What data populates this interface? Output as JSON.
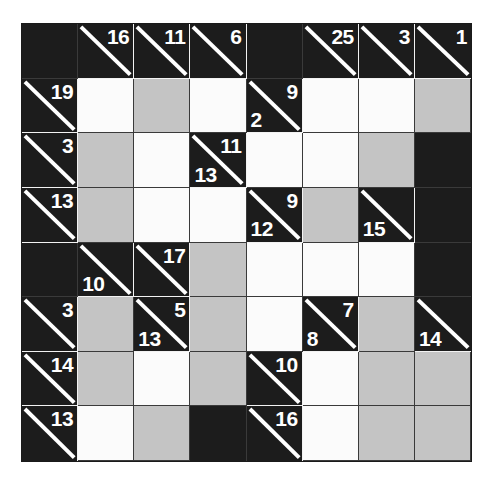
{
  "puzzle": {
    "name": "Kakuro",
    "rows": 8,
    "cols": 8,
    "colors": {
      "clue_cell": "#1c1c1c",
      "blank_cell": "#1c1c1c",
      "open_white": "#fbfbfb",
      "open_gray": "#c4c4c4",
      "clue_text": "#ffffff",
      "grid_line": "#f2f2f2",
      "page_background": "#ffffff"
    },
    "cells": [
      [
        {
          "type": "blank"
        },
        {
          "type": "clue",
          "across": "16",
          "down": ""
        },
        {
          "type": "clue",
          "across": "11",
          "down": ""
        },
        {
          "type": "clue",
          "across": "6",
          "down": ""
        },
        {
          "type": "blank"
        },
        {
          "type": "clue",
          "across": "25",
          "down": ""
        },
        {
          "type": "clue",
          "across": "3",
          "down": ""
        },
        {
          "type": "clue",
          "across": "1",
          "down": ""
        }
      ],
      [
        {
          "type": "clue",
          "across": "19",
          "down": ""
        },
        {
          "type": "open",
          "shade": "white",
          "value": ""
        },
        {
          "type": "open",
          "shade": "gray",
          "value": ""
        },
        {
          "type": "open",
          "shade": "white",
          "value": ""
        },
        {
          "type": "clue",
          "across": "9",
          "down": "2"
        },
        {
          "type": "open",
          "shade": "white",
          "value": ""
        },
        {
          "type": "open",
          "shade": "white",
          "value": ""
        },
        {
          "type": "open",
          "shade": "gray",
          "value": ""
        }
      ],
      [
        {
          "type": "clue",
          "across": "3",
          "down": ""
        },
        {
          "type": "open",
          "shade": "gray",
          "value": ""
        },
        {
          "type": "open",
          "shade": "white",
          "value": ""
        },
        {
          "type": "clue",
          "across": "11",
          "down": "13"
        },
        {
          "type": "open",
          "shade": "white",
          "value": ""
        },
        {
          "type": "open",
          "shade": "white",
          "value": ""
        },
        {
          "type": "open",
          "shade": "gray",
          "value": ""
        },
        {
          "type": "blank"
        }
      ],
      [
        {
          "type": "clue",
          "across": "13",
          "down": ""
        },
        {
          "type": "open",
          "shade": "gray",
          "value": ""
        },
        {
          "type": "open",
          "shade": "white",
          "value": ""
        },
        {
          "type": "open",
          "shade": "white",
          "value": ""
        },
        {
          "type": "clue",
          "across": "9",
          "down": "12"
        },
        {
          "type": "open",
          "shade": "gray",
          "value": ""
        },
        {
          "type": "clue",
          "across": "",
          "down": "15"
        },
        {
          "type": "blank"
        }
      ],
      [
        {
          "type": "blank"
        },
        {
          "type": "clue",
          "across": "",
          "down": "10"
        },
        {
          "type": "clue",
          "across": "17",
          "down": ""
        },
        {
          "type": "open",
          "shade": "gray",
          "value": ""
        },
        {
          "type": "open",
          "shade": "white",
          "value": ""
        },
        {
          "type": "open",
          "shade": "white",
          "value": ""
        },
        {
          "type": "open",
          "shade": "white",
          "value": ""
        },
        {
          "type": "blank"
        }
      ],
      [
        {
          "type": "clue",
          "across": "3",
          "down": ""
        },
        {
          "type": "open",
          "shade": "gray",
          "value": ""
        },
        {
          "type": "clue",
          "across": "5",
          "down": "13"
        },
        {
          "type": "open",
          "shade": "gray",
          "value": ""
        },
        {
          "type": "open",
          "shade": "white",
          "value": ""
        },
        {
          "type": "clue",
          "across": "7",
          "down": "8"
        },
        {
          "type": "open",
          "shade": "gray",
          "value": ""
        },
        {
          "type": "clue",
          "across": "",
          "down": "14"
        }
      ],
      [
        {
          "type": "clue",
          "across": "14",
          "down": ""
        },
        {
          "type": "open",
          "shade": "gray",
          "value": ""
        },
        {
          "type": "open",
          "shade": "white",
          "value": ""
        },
        {
          "type": "open",
          "shade": "gray",
          "value": ""
        },
        {
          "type": "clue",
          "across": "10",
          "down": ""
        },
        {
          "type": "open",
          "shade": "white",
          "value": ""
        },
        {
          "type": "open",
          "shade": "gray",
          "value": ""
        },
        {
          "type": "open",
          "shade": "gray",
          "value": ""
        }
      ],
      [
        {
          "type": "clue",
          "across": "13",
          "down": ""
        },
        {
          "type": "open",
          "shade": "white",
          "value": ""
        },
        {
          "type": "open",
          "shade": "gray",
          "value": ""
        },
        {
          "type": "blank"
        },
        {
          "type": "clue",
          "across": "16",
          "down": ""
        },
        {
          "type": "open",
          "shade": "white",
          "value": ""
        },
        {
          "type": "open",
          "shade": "gray",
          "value": ""
        },
        {
          "type": "open",
          "shade": "gray",
          "value": ""
        }
      ]
    ]
  }
}
